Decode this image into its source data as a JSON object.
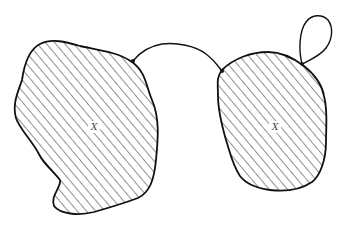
{
  "diagram": {
    "regions": [
      {
        "id": "left",
        "label": "X",
        "fill": "hatched"
      },
      {
        "id": "right",
        "label": "X",
        "fill": "hatched"
      }
    ],
    "connections": [
      {
        "type": "arc",
        "from": "left",
        "to": "right"
      },
      {
        "type": "loop",
        "at": "right"
      }
    ],
    "colors": {
      "stroke": "#111111",
      "hatch": "#333333",
      "background": "#ffffff"
    }
  }
}
